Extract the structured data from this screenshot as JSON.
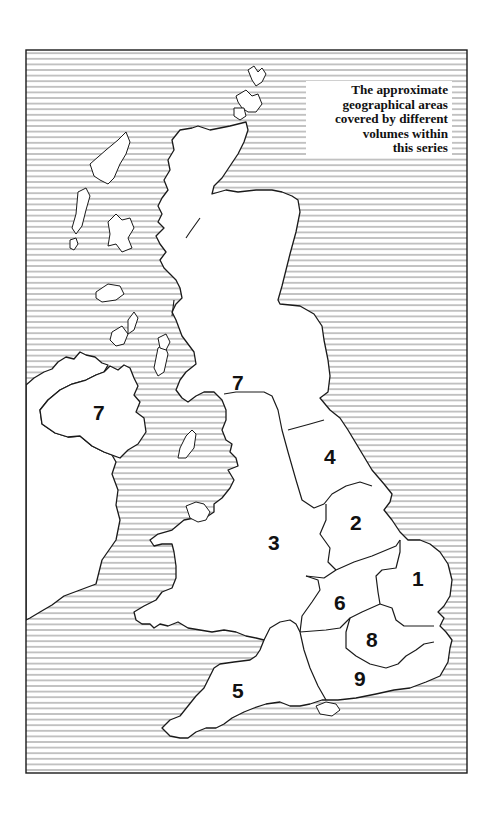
{
  "legend": {
    "lines": [
      "The approximate",
      "geographical areas",
      "covered by different",
      "volumes within",
      "this series"
    ]
  },
  "map": {
    "frame": {
      "x": 26,
      "y": 50,
      "width": 441,
      "height": 723
    },
    "hatch_spacing_px": 5.6,
    "hatch_color": "#8a8a8a",
    "land_color": "#ffffff",
    "outline_color": "#1a1a1a",
    "regions": [
      {
        "id": "7-scotland",
        "label": "7",
        "x": 240,
        "y": 390
      },
      {
        "id": "7-northern-ireland",
        "label": "7",
        "x": 100,
        "y": 419
      },
      {
        "id": "4",
        "label": "4",
        "x": 332,
        "y": 463
      },
      {
        "id": "2",
        "label": "2",
        "x": 358,
        "y": 528
      },
      {
        "id": "3",
        "label": "3",
        "x": 276,
        "y": 548
      },
      {
        "id": "1",
        "label": "1",
        "x": 418,
        "y": 585
      },
      {
        "id": "6",
        "label": "6",
        "x": 341,
        "y": 608
      },
      {
        "id": "8",
        "label": "8",
        "x": 374,
        "y": 645
      },
      {
        "id": "9",
        "label": "9",
        "x": 362,
        "y": 685
      },
      {
        "id": "5",
        "label": "5",
        "x": 240,
        "y": 697
      }
    ]
  }
}
